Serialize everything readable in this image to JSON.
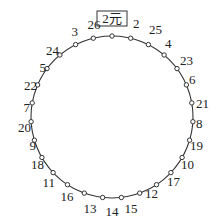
{
  "diagram": {
    "type": "circular-seating",
    "center": [
      112,
      117
    ],
    "radius": 81,
    "line_color": "#333333",
    "dot_fill": "#ffffff",
    "start_label": "2元",
    "points_clockwise_from_top": [
      {
        "label": "2元",
        "boxed": true,
        "lx": 112,
        "ly": 23,
        "anchor": "middle"
      },
      {
        "label": "2",
        "lx": 133,
        "ly": 28,
        "anchor": "start"
      },
      {
        "label": "25",
        "lx": 149,
        "ly": 34,
        "anchor": "start"
      },
      {
        "label": "4",
        "lx": 165,
        "ly": 48,
        "anchor": "start"
      },
      {
        "label": "23",
        "lx": 180,
        "ly": 65,
        "anchor": "start"
      },
      {
        "label": "6",
        "lx": 189,
        "ly": 84,
        "anchor": "start"
      },
      {
        "label": "21",
        "lx": 196,
        "ly": 108,
        "anchor": "start"
      },
      {
        "label": "8",
        "lx": 196,
        "ly": 128,
        "anchor": "start"
      },
      {
        "label": "19",
        "lx": 190,
        "ly": 150,
        "anchor": "start"
      },
      {
        "label": "10",
        "lx": 181,
        "ly": 169,
        "anchor": "start"
      },
      {
        "label": "17",
        "lx": 167,
        "ly": 186,
        "anchor": "start"
      },
      {
        "label": "12",
        "lx": 145,
        "ly": 198,
        "anchor": "start"
      },
      {
        "label": "15",
        "lx": 131,
        "ly": 213,
        "anchor": "middle"
      },
      {
        "label": "14",
        "lx": 112,
        "ly": 216,
        "anchor": "middle"
      },
      {
        "label": "13",
        "lx": 90,
        "ly": 213,
        "anchor": "middle"
      },
      {
        "label": "16",
        "lx": 67,
        "ly": 201,
        "anchor": "middle"
      },
      {
        "label": "11",
        "lx": 55,
        "ly": 187,
        "anchor": "end"
      },
      {
        "label": "18",
        "lx": 44,
        "ly": 169,
        "anchor": "end"
      },
      {
        "label": "9",
        "lx": 36,
        "ly": 150,
        "anchor": "end"
      },
      {
        "label": "20",
        "lx": 31,
        "ly": 132,
        "anchor": "end"
      },
      {
        "label": "7",
        "lx": 30,
        "ly": 112,
        "anchor": "end"
      },
      {
        "label": "22",
        "lx": 37,
        "ly": 90,
        "anchor": "end"
      },
      {
        "label": "5",
        "lx": 46,
        "ly": 72,
        "anchor": "end"
      },
      {
        "label": "24",
        "lx": 59,
        "ly": 55,
        "anchor": "end"
      },
      {
        "label": "3",
        "lx": 78,
        "ly": 36,
        "anchor": "end"
      },
      {
        "label": "26",
        "lx": 94,
        "ly": 29,
        "anchor": "middle"
      }
    ]
  }
}
